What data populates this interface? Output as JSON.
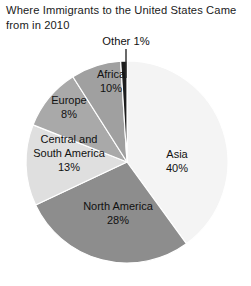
{
  "chart_data": {
    "type": "pie",
    "title": "Where Immigrants to the United States Came from in 2010",
    "xlabel": "",
    "ylabel": "",
    "legend": "none (labels on slices)",
    "grid": false,
    "units": "percent",
    "total": 100,
    "start_angle_deg": 0,
    "direction": "clockwise",
    "categories": [
      "Asia",
      "North America",
      "Central and South America",
      "Africa",
      "Europe",
      "Other"
    ],
    "values": [
      40,
      28,
      13,
      10,
      8,
      1
    ],
    "slices": [
      {
        "name": "Asia",
        "label": "Asia",
        "value_label": "40%",
        "value": 40,
        "color": "#f4f4f4",
        "label_placement": "inside",
        "label_x": 175,
        "label_y": 160
      },
      {
        "name": "North America",
        "label": "North America",
        "value_label": "28%",
        "value": 28,
        "color": "#8d8d8d",
        "label_placement": "inside",
        "label_x": 116,
        "label_y": 213
      },
      {
        "name": "Central and South America",
        "label_line1": "Central and",
        "label_line2": "South America",
        "value_label": "13%",
        "value": 13,
        "color": "#dfdfdf",
        "label_placement": "inside",
        "label_x": 68,
        "label_y": 146
      },
      {
        "name": "Africa",
        "label": "Africa",
        "value_label": "10%",
        "value": 10,
        "color": "#a9a9a9",
        "label_placement": "inside",
        "label_x": 111,
        "label_y": 81
      },
      {
        "name": "Europe",
        "label": "Europe",
        "value_label": "8%",
        "value": 8,
        "color": "#a0a0a0",
        "label_placement": "inside",
        "label_x": 68,
        "label_y": 106
      },
      {
        "name": "Other",
        "label": "Other 1%",
        "value_label": "1%",
        "value": 1,
        "color": "#1d1d1d",
        "label_placement": "callout",
        "label_x": 126,
        "label_y": 41
      }
    ],
    "geometry": {
      "center_x": 127,
      "center_y": 162,
      "radius": 101
    },
    "colors": {
      "background": "#ffffff",
      "text": "#111111",
      "slice_outline": "#ffffff",
      "leader_line": "#2a2a2a"
    }
  }
}
